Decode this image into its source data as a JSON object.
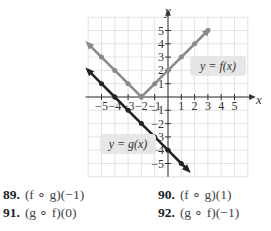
{
  "graph": {
    "x_axis_label": "x",
    "y_axis_label": "y",
    "x_ticks": [
      "-5",
      "-4",
      "-3",
      "-2",
      "-1",
      "1",
      "2",
      "3",
      "4",
      "5"
    ],
    "y_ticks": [
      "5",
      "4",
      "3",
      "2",
      "1",
      "-1",
      "-2",
      "-3",
      "-4",
      "-5"
    ],
    "f_label": "y = f(x)",
    "g_label": "y = g(x)",
    "colors": {
      "f_line": "#8a8a8a",
      "g_line": "#222222",
      "grid": "#e2e2e2",
      "label_bg": "#e6e6e6"
    }
  },
  "chart_data": {
    "type": "line",
    "title": "",
    "xlabel": "x",
    "ylabel": "y",
    "xlim": [
      -6,
      6
    ],
    "ylim": [
      -6,
      6
    ],
    "grid": true,
    "series": [
      {
        "name": "y = f(x)",
        "x": [
          -6,
          -5,
          -4,
          -3,
          -2,
          -1,
          0,
          1,
          2,
          3
        ],
        "y": [
          4,
          3,
          2,
          1,
          0,
          1,
          2,
          3,
          4,
          5
        ]
      },
      {
        "name": "y = g(x)",
        "x": [
          -6,
          -5,
          -4,
          -3,
          -2,
          -1,
          0,
          1,
          1.5
        ],
        "y": [
          2,
          1,
          0,
          -1,
          -2,
          -3,
          -4,
          -5,
          -5.5
        ]
      }
    ]
  },
  "problems": [
    {
      "number": "89.",
      "expression": "(f ∘ g)(−1)"
    },
    {
      "number": "90.",
      "expression": "(f ∘ g)(1)"
    },
    {
      "number": "91.",
      "expression": "(g ∘ f)(0)"
    },
    {
      "number": "92.",
      "expression": "(g ∘ f)(−1)"
    }
  ]
}
